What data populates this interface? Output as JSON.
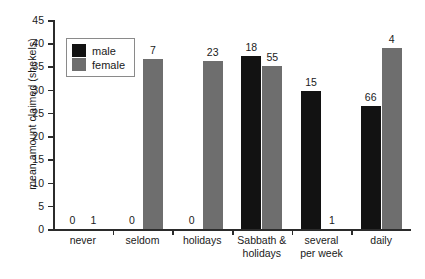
{
  "chart_data": {
    "type": "bar",
    "title": "",
    "xlabel": "",
    "ylabel": "mean amount claimed (shekels)",
    "ylim": [
      0,
      45
    ],
    "yticks": [
      0,
      5,
      10,
      15,
      20,
      25,
      30,
      35,
      40,
      45
    ],
    "grid": false,
    "legend_position": "upper-left-inside",
    "categories": [
      "never",
      "seldom",
      "holidays",
      "Sabbath &\nholidays",
      "several\nper week",
      "daily"
    ],
    "series": [
      {
        "name": "male",
        "color": "#121212",
        "values": [
          0,
          0,
          0,
          37.3,
          29.7,
          26.5
        ],
        "point_labels": [
          "0",
          "0",
          "0",
          "18",
          "15",
          "66"
        ]
      },
      {
        "name": "female",
        "color": "#6e6e6e",
        "values": [
          0,
          36.6,
          36.2,
          35.1,
          0,
          39.0
        ],
        "point_labels": [
          "1",
          "7",
          "23",
          "55",
          "1",
          "4"
        ]
      }
    ]
  },
  "legend": {
    "items": [
      {
        "label": "male",
        "color": "#121212"
      },
      {
        "label": "female",
        "color": "#6e6e6e"
      }
    ]
  },
  "axis": {
    "y_title": "mean amount claimed (shekels)",
    "y_tick_labels": [
      "0",
      "5",
      "10",
      "15",
      "20",
      "25",
      "30",
      "35",
      "40",
      "45"
    ],
    "x_tick_labels": [
      "never",
      "seldom",
      "holidays",
      "Sabbath &\nholidays",
      "several\nper week",
      "daily"
    ]
  }
}
